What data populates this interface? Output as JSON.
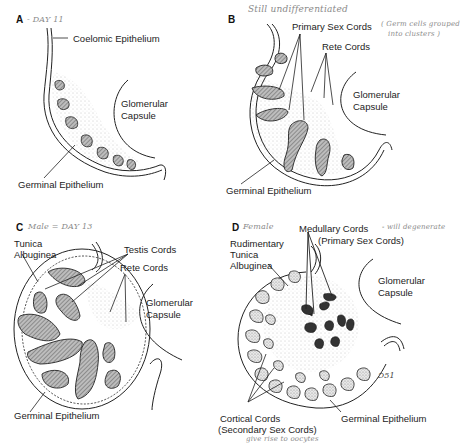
{
  "figure": {
    "panels": [
      {
        "letter": "A",
        "note": "- DAY 11",
        "labels": {
          "coelomic_epithelium": "Coelomic Epithelium",
          "glomerular_capsule_1": "Glomerular",
          "glomerular_capsule_2": "Capsule",
          "germinal_epithelium": "Germinal Epithelium"
        }
      },
      {
        "letter": "B",
        "note": "Still undifferentiated",
        "labels": {
          "primary_sex_cords": "Primary Sex Cords",
          "primary_note_1": "( Germ cells grouped",
          "primary_note_2": "into clusters )",
          "rete_cords": "Rete Cords",
          "glomerular_capsule_1": "Glomerular",
          "glomerular_capsule_2": "Capsule",
          "germinal_epithelium": "Germinal Epithelium"
        }
      },
      {
        "letter": "C",
        "note": "Male = DAY 13",
        "labels": {
          "tunica_1": "Tunica",
          "tunica_2": "Albuginea",
          "testis_cords": "Testis Cords",
          "rete_cords": "Rete Cords",
          "glomerular_capsule_1": "Glomerular",
          "glomerular_capsule_2": "Capsule",
          "germinal_epithelium": "Germinal Epithelium"
        }
      },
      {
        "letter": "D",
        "note": "Female",
        "labels": {
          "rudimentary_1": "Rudimentary",
          "rudimentary_2": "Tunica",
          "rudimentary_3": "Albuginea",
          "medullary_cords": "Medullary Cords",
          "medullary_note": "- will degenerate",
          "medullary_sub": "(Primary Sex Cords)",
          "glomerular_capsule_1": "Glomerular",
          "glomerular_capsule_2": "Capsule",
          "cortical_cords": "Cortical Cords",
          "cortical_sub": "(Secondary Sex Cords)",
          "cortical_note": "give rise to oocytes",
          "germinal_epithelium": "Germinal Epithelium",
          "signature": "Ɔ51"
        }
      }
    ]
  }
}
